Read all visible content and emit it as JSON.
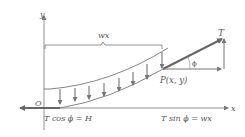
{
  "diagram": {
    "axes": {
      "x_label": "x",
      "y_label": "y",
      "origin_label": "O"
    },
    "point_label": "P(x, y)",
    "tension_label": "T",
    "angle_label": "ϕ",
    "load_label": "wx",
    "left_equation": "T cos ϕ = H",
    "right_equation": "T sin ϕ = wx",
    "colors": {
      "stroke": "#6f6f6f",
      "vector": "#777777",
      "text": "#555555"
    }
  }
}
